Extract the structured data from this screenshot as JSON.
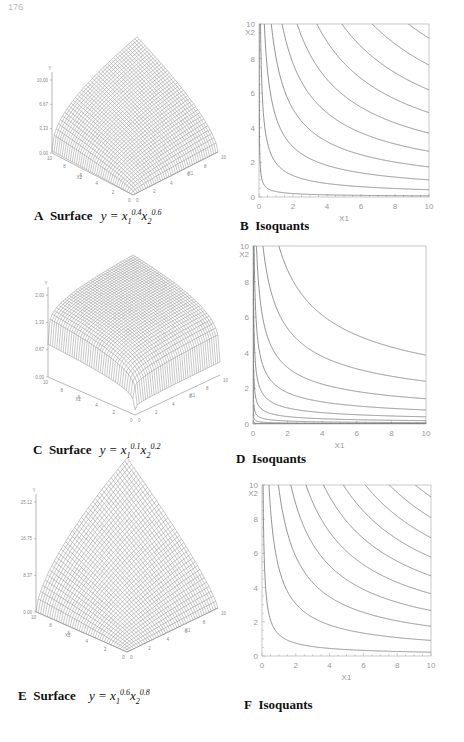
{
  "page_number": "176",
  "captions": {
    "A": {
      "letter": "A",
      "word": "Surface",
      "eq_y": "y",
      "x1": "x",
      "x1_sub": "1",
      "x1_exp": "0.4",
      "x2": "x",
      "x2_sub": "2",
      "x2_exp": "0.6"
    },
    "B": {
      "letter": "B",
      "word": "Isoquants"
    },
    "C": {
      "letter": "C",
      "word": "Surface",
      "eq_y": "y",
      "x1": "x",
      "x1_sub": "1",
      "x1_exp": "0.1",
      "x2": "x",
      "x2_sub": "2",
      "x2_exp": "0.2"
    },
    "D": {
      "letter": "D",
      "word": "Isoquants"
    },
    "E": {
      "letter": "E",
      "word": "Surface",
      "eq_y": "y",
      "x1": "x",
      "x1_sub": "1",
      "x1_exp": "0.6",
      "x2": "x",
      "x2_sub": "2",
      "x2_exp": "0.8"
    },
    "F": {
      "letter": "F",
      "word": "Isoquants"
    }
  },
  "chart_data": [
    {
      "id": "A",
      "type": "surface",
      "title": "Surface y = x1^0.4 x2^0.6",
      "zlabel": "Y",
      "xlabel": "X1",
      "ylabel": "X2",
      "z_ticks": [
        "0.00",
        "3.33",
        "6.67",
        "10.00"
      ],
      "x_range": [
        0,
        10
      ],
      "y_range": [
        0,
        10
      ],
      "alpha": 0.4,
      "beta": 0.6
    },
    {
      "id": "B",
      "type": "line",
      "title": "Isoquants",
      "xlabel": "X1",
      "ylabel": "X2",
      "x_ticks": [
        0,
        2,
        4,
        6,
        8,
        10
      ],
      "y_ticks": [
        0,
        2,
        4,
        6,
        8,
        10
      ],
      "xlim": [
        0,
        10
      ],
      "ylim": [
        0,
        10
      ],
      "alpha": 0.4,
      "beta": 0.6,
      "levels": [
        0.5,
        1.5,
        2.5,
        3.5,
        4.5,
        5.5,
        6.5,
        7.5,
        8.5,
        9.5
      ]
    },
    {
      "id": "C",
      "type": "surface",
      "title": "Surface y = x1^0.1 x2^0.2",
      "zlabel": "Y",
      "xlabel": "X1",
      "ylabel": "X2",
      "z_ticks": [
        "0.00",
        "0.67",
        "1.33",
        "2.00"
      ],
      "x_range": [
        0,
        10
      ],
      "y_range": [
        0,
        10
      ],
      "alpha": 0.1,
      "beta": 0.2
    },
    {
      "id": "D",
      "type": "line",
      "title": "Isoquants",
      "xlabel": "X1",
      "ylabel": "X2",
      "x_ticks": [
        0,
        2,
        4,
        6,
        8,
        10
      ],
      "y_ticks": [
        0,
        2,
        4,
        6,
        8,
        10
      ],
      "xlim": [
        0,
        10
      ],
      "ylim": [
        0,
        10
      ],
      "alpha": 0.1,
      "beta": 0.2,
      "levels": [
        0.3,
        0.45,
        0.6,
        0.75,
        0.9,
        1.05,
        1.2,
        1.35,
        1.5,
        1.65
      ]
    },
    {
      "id": "E",
      "type": "surface",
      "title": "Surface y = x1^0.6 x2^0.8",
      "zlabel": "Y",
      "xlabel": "X1",
      "ylabel": "X2",
      "z_ticks": [
        "0.00",
        "8.37",
        "16.75",
        "25.12"
      ],
      "x_range": [
        0,
        10
      ],
      "y_range": [
        0,
        10
      ],
      "alpha": 0.6,
      "beta": 0.8
    },
    {
      "id": "F",
      "type": "line",
      "title": "Isoquants",
      "xlabel": "X1",
      "ylabel": "X2",
      "x_ticks": [
        0,
        2,
        4,
        6,
        8,
        10
      ],
      "y_ticks": [
        0,
        2,
        4,
        6,
        8,
        10
      ],
      "xlim": [
        0,
        10
      ],
      "ylim": [
        0,
        10
      ],
      "alpha": 0.6,
      "beta": 0.8,
      "levels": [
        1.2,
        3.7,
        6.2,
        8.7,
        11.2,
        13.7,
        16.2,
        18.7,
        21.2,
        23.7
      ]
    }
  ]
}
